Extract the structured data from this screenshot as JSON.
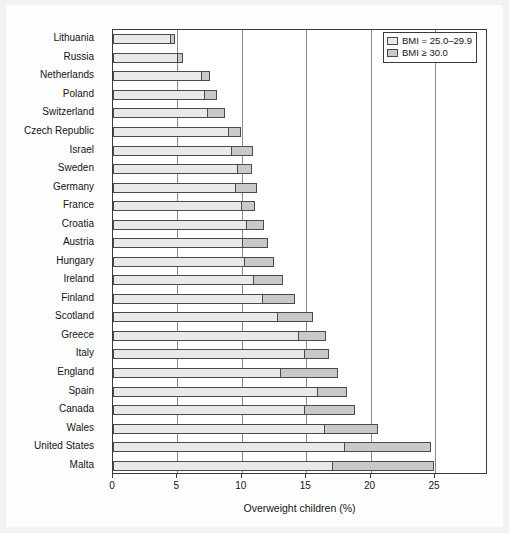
{
  "chart_data": {
    "type": "bar",
    "orientation": "horizontal",
    "stacked": true,
    "title": "",
    "xlabel": "Overweight children (%)",
    "ylabel": "",
    "xlim": [
      0,
      29.1
    ],
    "xticks": [
      0,
      5,
      10,
      15,
      20,
      25
    ],
    "grid": "vertical",
    "legend_position": "top-right",
    "categories": [
      "Lithuania",
      "Russia",
      "Netherlands",
      "Poland",
      "Switzerland",
      "Czech Republic",
      "Israel",
      "Sweden",
      "Germany",
      "France",
      "Croatia",
      "Austria",
      "Hungary",
      "Ireland",
      "Finland",
      "Scotland",
      "Greece",
      "Italy",
      "England",
      "Spain",
      "Canada",
      "Wales",
      "United States",
      "Malta"
    ],
    "series": [
      {
        "name": "BMI = 25.0–29.9",
        "color": "#e9e9e9",
        "values": [
          4.4,
          5.0,
          6.8,
          7.1,
          7.3,
          8.9,
          9.2,
          9.6,
          9.5,
          9.9,
          10.3,
          10.0,
          10.2,
          10.9,
          11.6,
          12.7,
          14.4,
          14.8,
          13.0,
          15.8,
          14.8,
          16.4,
          17.9,
          17.0
        ]
      },
      {
        "name": "BMI ≥ 30.0",
        "color": "#c9c9c9",
        "values": [
          0.4,
          0.4,
          0.7,
          1.0,
          1.4,
          1.0,
          1.7,
          1.2,
          1.7,
          1.1,
          1.4,
          2.0,
          2.3,
          2.3,
          2.5,
          2.8,
          2.1,
          2.0,
          4.5,
          2.4,
          4.0,
          4.2,
          6.8,
          7.9
        ]
      }
    ],
    "totals": [
      4.8,
      5.4,
      7.5,
      8.1,
      8.7,
      9.9,
      10.9,
      10.8,
      11.2,
      11.0,
      11.7,
      12.0,
      12.5,
      13.2,
      14.1,
      15.5,
      16.5,
      16.8,
      17.5,
      18.2,
      18.8,
      20.6,
      24.7,
      24.9
    ]
  },
  "legend": {
    "items": [
      {
        "label": "BMI = 25.0–29.9",
        "swatch": "light"
      },
      {
        "label": "BMI ≥ 30.0",
        "swatch": "dark"
      }
    ]
  }
}
